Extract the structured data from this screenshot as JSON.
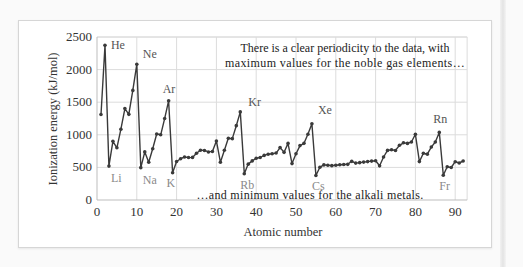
{
  "chart_data": {
    "type": "line",
    "title": "",
    "xlabel": "Atomic number",
    "ylabel": "Ionization energy (kJ/mol)",
    "xlim": [
      0,
      93
    ],
    "ylim": [
      0,
      2500
    ],
    "grid": true,
    "x_ticks": [
      0,
      10,
      20,
      30,
      40,
      50,
      60,
      70,
      80,
      90
    ],
    "y_ticks": [
      0,
      500,
      1000,
      1500,
      2000,
      2500
    ],
    "series": [
      {
        "name": "First ionization energy",
        "color": "#3a3a3a",
        "x": [
          1,
          2,
          3,
          4,
          5,
          6,
          7,
          8,
          9,
          10,
          11,
          12,
          13,
          14,
          15,
          16,
          17,
          18,
          19,
          20,
          21,
          22,
          23,
          24,
          25,
          26,
          27,
          28,
          29,
          30,
          31,
          32,
          33,
          34,
          35,
          36,
          37,
          38,
          39,
          40,
          41,
          42,
          43,
          44,
          45,
          46,
          47,
          48,
          49,
          50,
          51,
          52,
          53,
          54,
          55,
          56,
          57,
          58,
          59,
          60,
          61,
          62,
          63,
          64,
          65,
          66,
          67,
          68,
          69,
          70,
          71,
          72,
          73,
          74,
          75,
          76,
          77,
          78,
          79,
          80,
          81,
          82,
          83,
          84,
          85,
          86,
          87,
          88,
          89,
          90,
          91,
          92
        ],
        "values": [
          1312,
          2372,
          520,
          900,
          801,
          1086,
          1402,
          1314,
          1681,
          2081,
          496,
          738,
          578,
          787,
          1012,
          1000,
          1251,
          1521,
          419,
          590,
          633,
          659,
          651,
          653,
          717,
          763,
          760,
          737,
          745,
          906,
          579,
          762,
          947,
          941,
          1140,
          1351,
          403,
          550,
          600,
          640,
          652,
          684,
          702,
          710,
          720,
          804,
          731,
          868,
          558,
          709,
          834,
          869,
          1008,
          1170,
          376,
          503,
          538,
          534,
          527,
          533,
          540,
          545,
          547,
          593,
          566,
          573,
          581,
          589,
          597,
          603,
          524,
          659,
          761,
          770,
          760,
          839,
          878,
          868,
          890,
          1007,
          589,
          716,
          703,
          812,
          890,
          1037,
          380,
          509,
          499,
          587,
          568,
          598
        ]
      }
    ],
    "labels": {
      "maxima": [
        {
          "text": "He",
          "x": 2,
          "y": 2372
        },
        {
          "text": "Ne",
          "x": 10,
          "y": 2081
        },
        {
          "text": "Ar",
          "x": 18,
          "y": 1521
        },
        {
          "text": "Kr",
          "x": 36,
          "y": 1351
        },
        {
          "text": "Xe",
          "x": 54,
          "y": 1170
        },
        {
          "text": "Rn",
          "x": 86,
          "y": 1037
        }
      ],
      "minima": [
        {
          "text": "Li",
          "x": 3,
          "y": 520
        },
        {
          "text": "Na",
          "x": 11,
          "y": 496
        },
        {
          "text": "K",
          "x": 19,
          "y": 419
        },
        {
          "text": "Rb",
          "x": 37,
          "y": 403
        },
        {
          "text": "Cs",
          "x": 55,
          "y": 376
        },
        {
          "text": "Fr",
          "x": 87,
          "y": 380
        }
      ]
    },
    "annotations": [
      "There is a clear periodicity to the data, with",
      "maximum values for the noble gas elements…",
      "…and minimum values for the alkali metals."
    ]
  }
}
